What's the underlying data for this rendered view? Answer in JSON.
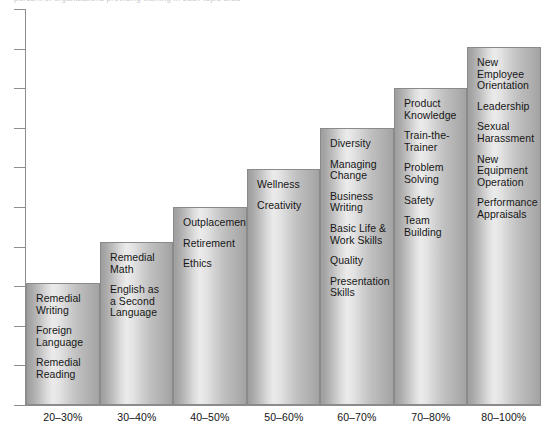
{
  "caption": {
    "text": "percent of organizations providing training in each topic area"
  },
  "chart_data": {
    "type": "bar",
    "title": "",
    "subtitle": "",
    "xlabel": "",
    "ylabel": "",
    "grid": false,
    "legend": false,
    "y_axis": {
      "labels_visible": false,
      "tick_count": 10,
      "range_note": "unlabeled tick marks"
    },
    "categories": [
      "20–30%",
      "30–40%",
      "40–50%",
      "50–60%",
      "60–70%",
      "70–80%",
      "80–100%"
    ],
    "values": [
      30,
      40,
      50,
      60,
      70,
      80,
      100
    ],
    "bar_pixel_heights": [
      122,
      163,
      198,
      236,
      277,
      317,
      358
    ],
    "series": [
      {
        "name": "Training topics by share of organizations",
        "values": [
          30,
          40,
          50,
          60,
          70,
          80,
          100
        ]
      }
    ],
    "bars": [
      {
        "category": "20–30%",
        "value": 30,
        "items": [
          "Remedial\nWriting",
          "Foreign\nLanguage",
          "Remedial\nReading"
        ]
      },
      {
        "category": "30–40%",
        "value": 40,
        "items": [
          "Remedial\nMath",
          "English as\na  Second\nLanguage"
        ]
      },
      {
        "category": "40–50%",
        "value": 50,
        "items": [
          "Outplacement",
          "Retirement",
          "Ethics"
        ]
      },
      {
        "category": "50–60%",
        "value": 60,
        "items": [
          "Wellness",
          "Creativity"
        ]
      },
      {
        "category": "60–70%",
        "value": 70,
        "items": [
          "Diversity",
          "Managing\nChange",
          "Business\nWriting",
          "Basic Life &\nWork Skills",
          "Quality",
          "Presentation\nSkills"
        ]
      },
      {
        "category": "70–80%",
        "value": 80,
        "items": [
          "Product\nKnowledge",
          "Train-the-\nTrainer",
          "Problem\nSolving",
          "Safety",
          "Team\nBuilding"
        ]
      },
      {
        "category": "80–100%",
        "value": 100,
        "items": [
          "New\nEmployee\nOrientation",
          "Leadership",
          "Sexual\nHarassment",
          "New\nEquipment\nOperation",
          "Performance\nAppraisals"
        ]
      }
    ],
    "colors": {
      "bar_edge": "#8a8a8a",
      "bar_light": "#ebebeb",
      "bar_dark": "#9e9e9e",
      "axis": "#8d8d8d",
      "text": "#171717",
      "background": "#ffffff"
    }
  }
}
